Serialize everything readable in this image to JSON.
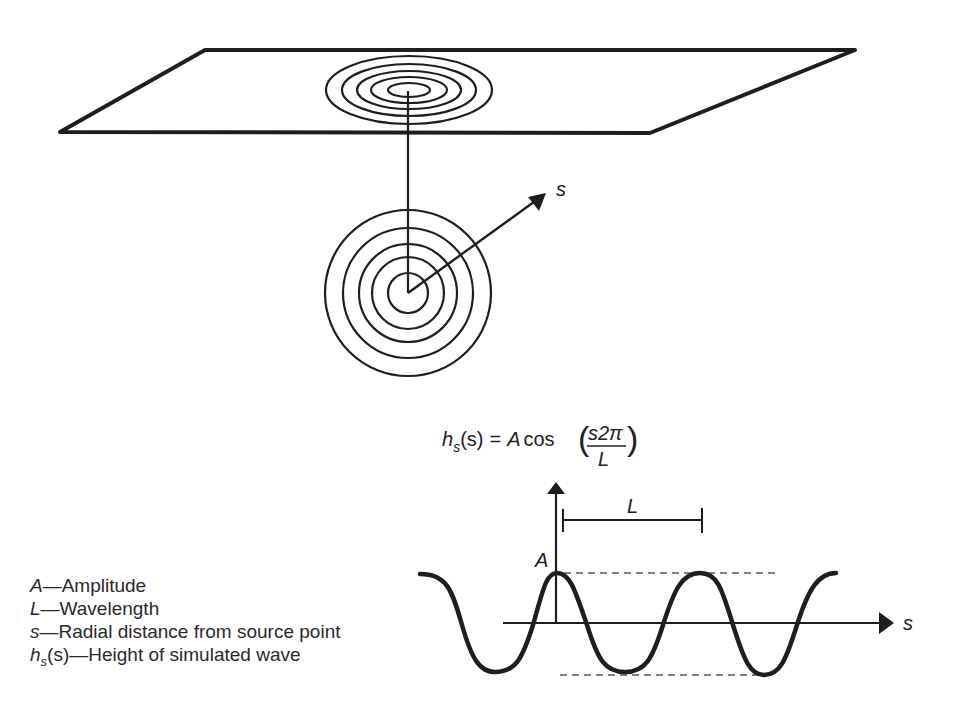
{
  "diagram": {
    "title_equation": {
      "lhs_func": "h",
      "lhs_sub": "s",
      "lhs_arg": "(s)",
      "equals": "=",
      "amp": "A",
      "func": "cos",
      "numerator": "s2π",
      "denominator": "L"
    },
    "radial_axis_label": "s",
    "wave_axis_label": "s",
    "amplitude_label": "A",
    "wavelength_label": "L",
    "ring_counts": {
      "plane_rings": 5,
      "source_rings": 5
    }
  },
  "legend": [
    {
      "symbol": "A",
      "sub": "",
      "arg": "",
      "dash": "—",
      "text": "Amplitude"
    },
    {
      "symbol": "L",
      "sub": "",
      "arg": "",
      "dash": "—",
      "text": "Wavelength"
    },
    {
      "symbol": "s",
      "sub": "",
      "arg": "",
      "dash": "—",
      "text": "Radial distance from source point"
    },
    {
      "symbol": "h",
      "sub": "s",
      "arg": "(s)",
      "dash": "—",
      "text": "Height of simulated wave"
    }
  ],
  "colors": {
    "stroke": "#1e1e1e",
    "dashed": "#555555",
    "background": "#ffffff"
  }
}
